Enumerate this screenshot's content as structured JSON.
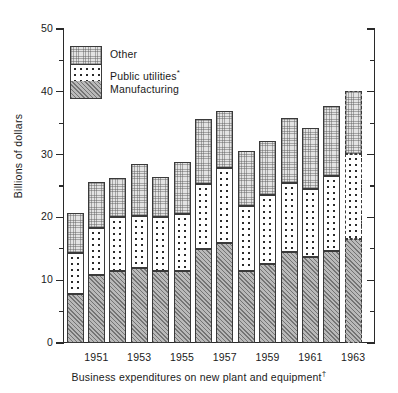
{
  "chart_data": {
    "type": "bar",
    "subtype": "stacked",
    "title": "",
    "xlabel": "Business expenditures on new plant and equipment †",
    "ylabel": "Billions of dollars",
    "ylim": [
      0,
      50
    ],
    "ytick_labels": [
      "0",
      "10",
      "20",
      "30",
      "40",
      "50"
    ],
    "ytick_values": [
      0,
      10,
      20,
      30,
      40,
      50
    ],
    "yminor_step": 5,
    "grid": false,
    "legend_position": "upper-left-inside",
    "categories": [
      1950,
      1951,
      1952,
      1953,
      1954,
      1955,
      1956,
      1957,
      1958,
      1959,
      1960,
      1961,
      1962,
      1963
    ],
    "xtick_labels": [
      "1951",
      "1953",
      "1955",
      "1957",
      "1959",
      "1961",
      "1963"
    ],
    "series": [
      {
        "name": "Manufacturing",
        "pattern": "diagonal-hatch",
        "values": [
          7.8,
          10.8,
          11.4,
          11.9,
          11.5,
          11.4,
          15.0,
          15.9,
          11.4,
          12.6,
          14.5,
          13.7,
          14.7,
          16.6
        ]
      },
      {
        "name": "Public utilities*",
        "pattern": "polka-dots",
        "values": [
          6.5,
          7.5,
          8.7,
          8.4,
          8.5,
          9.2,
          10.4,
          12.0,
          10.4,
          11.0,
          11.0,
          10.8,
          11.9,
          13.5
        ]
      },
      {
        "name": "Other",
        "pattern": "fine-stipple",
        "values": [
          6.4,
          7.4,
          6.1,
          8.2,
          6.5,
          8.2,
          10.2,
          9.1,
          8.8,
          8.6,
          10.3,
          9.8,
          11.2,
          10.0
        ]
      }
    ],
    "totals": [
      20.7,
      25.7,
      26.2,
      28.5,
      26.5,
      28.8,
      35.6,
      37.0,
      30.6,
      32.2,
      35.8,
      34.3,
      37.8,
      40.1
    ],
    "estimated_categories": [
      1963
    ],
    "estimate_style": "dashed-outline"
  },
  "legend": {
    "items": [
      {
        "label": "Other",
        "pattern": "fine-stipple"
      },
      {
        "label": "Public utilities",
        "superscript": "*",
        "pattern": "polka-dots"
      },
      {
        "label": "Manufacturing",
        "pattern": "diagonal-hatch"
      }
    ]
  },
  "axes": {
    "y_title": "Billions of dollars",
    "x_title": "Business expenditures on new plant and equipment",
    "x_title_superscript": "†"
  }
}
